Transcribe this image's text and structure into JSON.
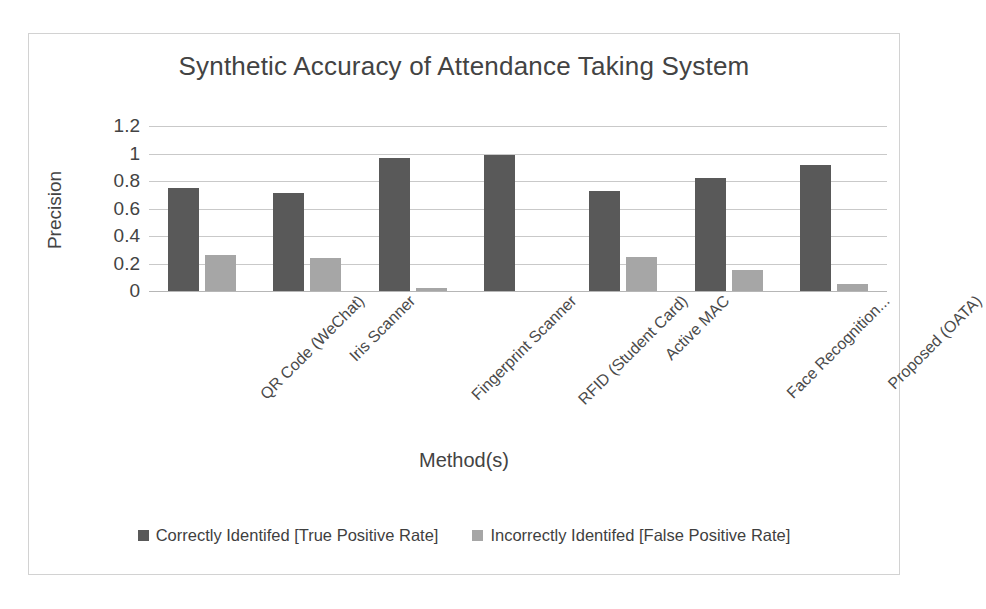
{
  "chart_data": {
    "type": "bar",
    "title": "Synthetic Accuracy of Attendance Taking System",
    "xlabel": "Method(s)",
    "ylabel": "Precision",
    "ylim": [
      0,
      1.2
    ],
    "grid": true,
    "legend_position": "bottom",
    "yticks": [
      "1.2",
      "1",
      "0.8",
      "0.6",
      "0.4",
      "0.2",
      "0"
    ],
    "ytick_values": [
      1.2,
      1,
      0.8,
      0.6,
      0.4,
      0.2,
      0
    ],
    "categories": [
      "QR Code (WeChat)",
      "Iris Scanner",
      "Fingerprint Scanner",
      "RFID (Student Card)",
      "Active MAC",
      "Face Recognition...",
      "Proposed (OATA)"
    ],
    "series": [
      {
        "name": "Correctly Identifed [True Positive Rate]",
        "color": "#595959",
        "values": [
          0.75,
          0.71,
          0.97,
          0.99,
          0.73,
          0.82,
          0.92
        ]
      },
      {
        "name": "Incorrectly Identifed [False Positive Rate]",
        "color": "#a6a6a6",
        "values": [
          0.26,
          0.24,
          0.02,
          0.0,
          0.25,
          0.15,
          0.05
        ]
      }
    ]
  },
  "frame": {
    "border_color": "#d2d2d2"
  }
}
